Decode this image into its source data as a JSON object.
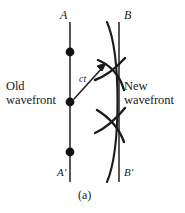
{
  "figure": {
    "caption": "(a)",
    "background_color": "#fefefe",
    "ink_color": "#1b1b1b",
    "labels": {
      "A": "A",
      "B": "B",
      "A_prime": "A′",
      "B_prime": "B′",
      "ct": "ct",
      "old_wavefront_line1": "Old",
      "old_wavefront_line2": "wavefront",
      "new_wavefront_line1": "New",
      "new_wavefront_line2": "wavefront"
    },
    "geometry": {
      "old_wavefront_line": {
        "x": 70,
        "y_top": 22,
        "y_bottom": 182
      },
      "new_wavefront_line": {
        "x": 119,
        "y_top": 22,
        "y_bottom": 182
      },
      "source_points": [
        {
          "x": 70,
          "y": 52
        },
        {
          "x": 70,
          "y": 102
        },
        {
          "x": 70,
          "y": 152
        }
      ],
      "envelope_arc": {
        "x_top": 107,
        "x_bulge": 122,
        "x_bottom": 107,
        "y_top": 22,
        "y_bottom": 182
      },
      "ct_arrow": {
        "from_x": 73,
        "from_y": 99,
        "to_x": 106,
        "to_y": 64
      }
    }
  }
}
